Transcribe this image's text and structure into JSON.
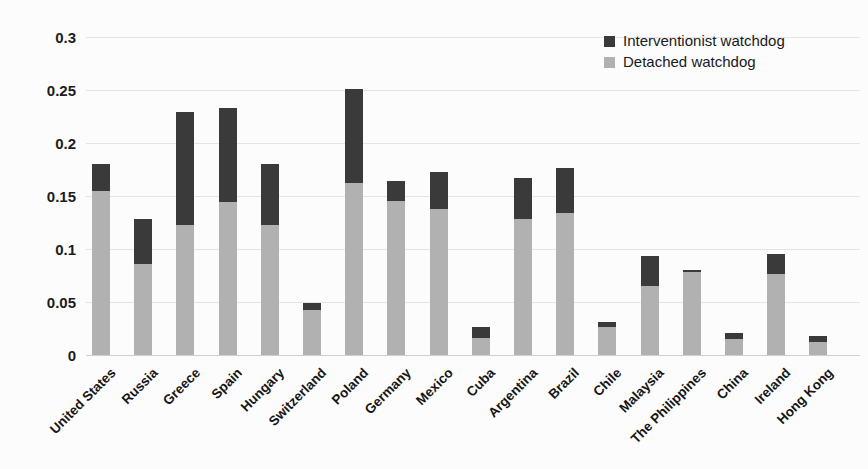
{
  "chart_data": {
    "type": "bar",
    "stacked": true,
    "title": "",
    "xlabel": "",
    "ylabel": "",
    "ylim": [
      0,
      0.3
    ],
    "grid": true,
    "legend_position": "top-right",
    "y_tick_labels": [
      "0",
      "0.05",
      "0.1",
      "0.15",
      "0.2",
      "0.25",
      "0.3"
    ],
    "categories": [
      "United States",
      "Russia",
      "Greece",
      "Spain",
      "Hungary",
      "Switzerland",
      "Poland",
      "Germany",
      "Mexico",
      "Cuba",
      "Argentina",
      "Brazil",
      "Chile",
      "Malaysia",
      "The Philippines",
      "China",
      "Ireland",
      "Hong Kong"
    ],
    "series": [
      {
        "name": "Detached watchdog",
        "color": "#b1b1b1",
        "values": [
          0.155,
          0.086,
          0.123,
          0.144,
          0.123,
          0.042,
          0.162,
          0.145,
          0.138,
          0.016,
          0.128,
          0.134,
          0.026,
          0.065,
          0.078,
          0.015,
          0.076,
          0.012
        ]
      },
      {
        "name": "Interventionist watchdog",
        "color": "#3a3a3a",
        "values": [
          0.025,
          0.042,
          0.106,
          0.089,
          0.057,
          0.007,
          0.089,
          0.019,
          0.035,
          0.01,
          0.039,
          0.042,
          0.005,
          0.028,
          0.002,
          0.006,
          0.019,
          0.006
        ]
      }
    ],
    "totals": [
      0.18,
      0.128,
      0.229,
      0.233,
      0.18,
      0.049,
      0.251,
      0.164,
      0.173,
      0.026,
      0.167,
      0.176,
      0.031,
      0.093,
      0.08,
      0.021,
      0.095,
      0.018
    ],
    "legend_order": [
      "Interventionist watchdog",
      "Detached watchdog"
    ]
  },
  "colors": {
    "interventionist": "#3a3a3a",
    "detached": "#b1b1b1",
    "gridline": "#e4e4e4",
    "axis_line": "#cfcfcf",
    "text": "#1c1c1c",
    "background": "#fcfcfc"
  }
}
